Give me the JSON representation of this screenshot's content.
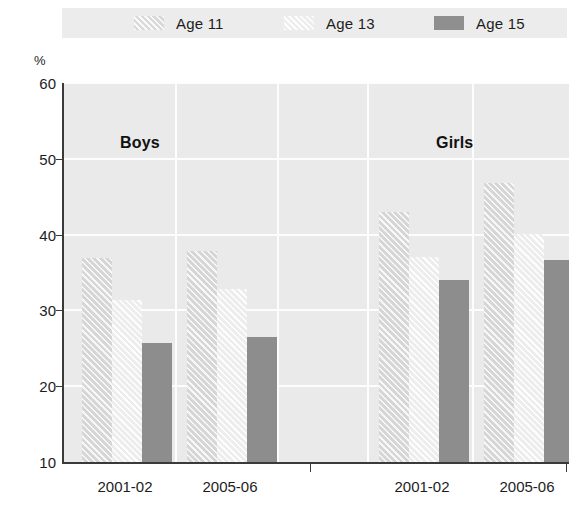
{
  "legend": {
    "position": "top",
    "items": [
      {
        "label": "Age 11",
        "key": "age11",
        "swatch": "hatched-light-gray"
      },
      {
        "label": "Age 13",
        "key": "age13",
        "swatch": "hatched-very-light"
      },
      {
        "label": "Age 15",
        "key": "age15",
        "swatch": "solid-gray"
      }
    ]
  },
  "axis": {
    "y_unit_label": "%",
    "y_ticks": [
      10,
      20,
      30,
      40,
      50,
      60
    ],
    "y_tick_labels": [
      "10",
      "20",
      "30",
      "40",
      "50",
      "60"
    ]
  },
  "group_titles": [
    {
      "label": "Boys"
    },
    {
      "label": "Girls"
    }
  ],
  "chart_data": {
    "type": "bar",
    "title": "",
    "subtitle": "",
    "xlabel": "",
    "ylabel": "%",
    "ylim": [
      10,
      60
    ],
    "ytick_step": 10,
    "grid": "horizontal-and-vertical-white",
    "legend_position": "top",
    "categories": [
      "2001-02",
      "2005-06",
      "2001-02",
      "2005-06"
    ],
    "category_groups": [
      "Boys",
      "Boys",
      "Girls",
      "Girls"
    ],
    "series": [
      {
        "name": "Age 11",
        "values": [
          36.9,
          37.8,
          43.0,
          46.8
        ]
      },
      {
        "name": "Age 13",
        "values": [
          31.4,
          32.8,
          37.0,
          40.1
        ]
      },
      {
        "name": "Age 15",
        "values": [
          25.7,
          26.5,
          34.0,
          36.6
        ]
      }
    ],
    "colors": {
      "age11": "#d6d6d6",
      "age13": "#ededed",
      "age15": "#8d8d8d",
      "plot_background": "#eaeaea",
      "gridline": "#fdfdfd",
      "axis": "#3a3a3a",
      "text": "#1d1d1d"
    }
  }
}
